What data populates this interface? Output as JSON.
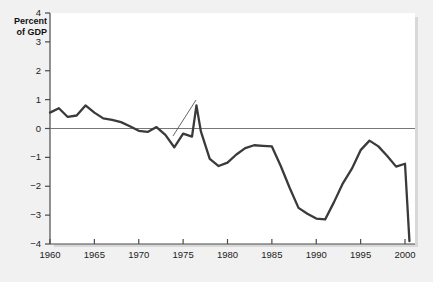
{
  "chart_data": {
    "type": "line",
    "title": "",
    "xlabel": "",
    "ylabel": "Percent of GDP",
    "ylabel_line1": "Percent",
    "ylabel_line2": "of GDP",
    "xlim": [
      1960,
      2000.5
    ],
    "ylim": [
      -4,
      4
    ],
    "yticks": [
      4,
      3,
      2,
      1,
      0,
      -1,
      -2,
      -3,
      -4
    ],
    "ytick_labels": [
      "4",
      "3",
      "2",
      "1",
      "0",
      "−1",
      "−2",
      "−3",
      "−4"
    ],
    "xticks": [
      1960,
      1965,
      1970,
      1975,
      1980,
      1985,
      1990,
      1995,
      2000
    ],
    "xtick_labels": [
      "1960",
      "1965",
      "1970",
      "1975",
      "1980",
      "1985",
      "1990",
      "1995",
      "2000"
    ],
    "grid": false,
    "legend": false,
    "zero_line": true,
    "annotations": [
      {
        "text": "Net capital outflow",
        "line1": "Net capital",
        "line2": "outflow",
        "points_to_year": 1976,
        "points_to_value": 0.55
      }
    ],
    "series": [
      {
        "name": "Net capital outflow",
        "color": "#3a3a3a",
        "x": [
          1960,
          1961,
          1962,
          1963,
          1964,
          1965,
          1966,
          1967,
          1968,
          1969,
          1970,
          1971,
          1972,
          1973,
          1974,
          1975,
          1976,
          1977,
          1978,
          1979,
          1980,
          1981,
          1982,
          1983,
          1984,
          1985,
          1986,
          1987,
          1988,
          1989,
          1990,
          1991,
          1992,
          1993,
          1994,
          1995,
          1996,
          1997,
          1998,
          1999,
          2000
        ],
        "values": [
          0.55,
          0.7,
          0.4,
          0.45,
          0.8,
          0.55,
          0.35,
          0.3,
          0.25,
          0.1,
          -0.05,
          -0.1,
          0.05,
          -0.2,
          -0.65,
          -0.1,
          -0.25,
          0.8,
          0.05,
          -1.3,
          -1.3,
          -1.1,
          -0.8,
          -0.6,
          -0.6,
          -0.6,
          -0.65,
          -1.6,
          -2.75,
          -2.95,
          -3.1,
          -3.15,
          -2.7,
          -2.0,
          -1.4,
          -0.55,
          -0.4,
          -0.7,
          -1.05,
          -1.3,
          -1.25
        ],
        "values_note": "values read from plot; see points array for exact rendering"
      }
    ],
    "points": [
      [
        1960,
        0.55
      ],
      [
        1961,
        0.7
      ],
      [
        1962,
        0.4
      ],
      [
        1963,
        0.45
      ],
      [
        1964,
        0.8
      ],
      [
        1965,
        0.55
      ],
      [
        1966,
        0.35
      ],
      [
        1967,
        0.3
      ],
      [
        1968,
        0.25
      ],
      [
        1969,
        0.1
      ],
      [
        1970,
        -0.05
      ],
      [
        1971,
        -0.1
      ],
      [
        1972,
        0.05
      ],
      [
        1973,
        -0.2
      ],
      [
        1974,
        -0.65
      ],
      [
        1975,
        -0.1
      ],
      [
        1976,
        -0.25
      ],
      [
        1977,
        0.8
      ],
      [
        1977.5,
        0.05
      ],
      [
        1978,
        -1.3
      ],
      [
        1979,
        -1.3
      ],
      [
        1980,
        -1.1
      ],
      [
        1981,
        -0.8
      ],
      [
        1982,
        -0.6
      ],
      [
        1983,
        -0.6
      ],
      [
        1984,
        -0.6
      ],
      [
        1985,
        -0.65
      ],
      [
        1986,
        -1.6
      ],
      [
        1987,
        -2.75
      ],
      [
        1988,
        -2.95
      ],
      [
        1989,
        -3.1
      ],
      [
        1990,
        -3.15
      ],
      [
        1991,
        -2.7
      ],
      [
        1992,
        -2.0
      ],
      [
        1993,
        -1.4
      ],
      [
        1994,
        -0.55
      ],
      [
        1995,
        -0.4
      ],
      [
        1996,
        -0.7
      ],
      [
        1997,
        -1.05
      ],
      [
        1998,
        -1.3
      ],
      [
        1999,
        -1.25
      ],
      [
        2000,
        -3.9
      ]
    ],
    "line_points": [
      [
        1960,
        0.55
      ],
      [
        1961,
        0.7
      ],
      [
        1962,
        0.4
      ],
      [
        1963,
        0.45
      ],
      [
        1964,
        0.8
      ],
      [
        1965,
        0.55
      ],
      [
        1966,
        0.35
      ],
      [
        1967,
        0.3
      ],
      [
        1968,
        0.22
      ],
      [
        1969,
        0.08
      ],
      [
        1970,
        -0.08
      ],
      [
        1971,
        -0.12
      ],
      [
        1972,
        0.05
      ],
      [
        1973,
        -0.22
      ],
      [
        1974,
        -0.65
      ],
      [
        1975,
        -0.18
      ],
      [
        1976,
        -0.28
      ],
      [
        1976.5,
        0.8
      ],
      [
        1977,
        -0.1
      ],
      [
        1978,
        -1.05
      ],
      [
        1979,
        -1.3
      ],
      [
        1980,
        -1.18
      ],
      [
        1981,
        -0.9
      ],
      [
        1982,
        -0.68
      ],
      [
        1983,
        -0.58
      ],
      [
        1984,
        -0.6
      ],
      [
        1985,
        -0.62
      ],
      [
        1986,
        -1.3
      ],
      [
        1987,
        -2.05
      ],
      [
        1988,
        -2.75
      ],
      [
        1989,
        -2.95
      ],
      [
        1990,
        -3.12
      ],
      [
        1991,
        -3.15
      ],
      [
        1992,
        -2.55
      ],
      [
        1993,
        -1.9
      ],
      [
        1994,
        -1.4
      ],
      [
        1995,
        -0.75
      ],
      [
        1996,
        -0.42
      ],
      [
        1997,
        -0.62
      ],
      [
        1998,
        -0.95
      ],
      [
        1999,
        -1.32
      ],
      [
        2000,
        -1.22
      ],
      [
        2000.5,
        -3.9
      ]
    ],
    "axis_color": "#555555",
    "line_color": "#3a3a3a",
    "background_color": "#f1f1f1",
    "plot_background_color": "#ffffff"
  },
  "axis": {
    "yticks": [
      {
        "label": "4",
        "value": 4
      },
      {
        "label": "3",
        "value": 3
      },
      {
        "label": "2",
        "value": 2
      },
      {
        "label": "1",
        "value": 1
      },
      {
        "label": "0",
        "value": 0
      },
      {
        "label": "−1",
        "value": -1
      },
      {
        "label": "−2",
        "value": -2
      },
      {
        "label": "−3",
        "value": -3
      },
      {
        "label": "−4",
        "value": -4
      }
    ],
    "xticks": [
      {
        "label": "1960",
        "value": 1960
      },
      {
        "label": "1965",
        "value": 1965
      },
      {
        "label": "1970",
        "value": 1970
      },
      {
        "label": "1975",
        "value": 1975
      },
      {
        "label": "1980",
        "value": 1980
      },
      {
        "label": "1985",
        "value": 1985
      },
      {
        "label": "1990",
        "value": 1990
      },
      {
        "label": "1995",
        "value": 1995
      },
      {
        "label": "2000",
        "value": 2000
      }
    ]
  },
  "labels": {
    "ylabel_line1": "Percent",
    "ylabel_line2": "of GDP",
    "annotation_line1": "Net capital",
    "annotation_line2": "outflow"
  }
}
